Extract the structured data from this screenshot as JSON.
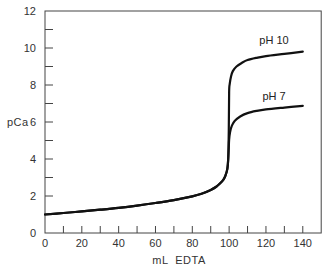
{
  "chart_data": {
    "type": "line",
    "title": "",
    "xlabel": "mL  EDTA",
    "ylabel": "pCa",
    "xlim": [
      0,
      150
    ],
    "ylim": [
      0,
      12
    ],
    "grid": false,
    "legend": "inline labels at curve ends",
    "x_ticks": [
      0,
      20,
      40,
      60,
      80,
      100,
      120,
      140
    ],
    "x_minor_ticks": [
      10,
      30,
      50,
      70,
      90,
      110,
      130
    ],
    "y_ticks": [
      0,
      2,
      4,
      6,
      8,
      10,
      12
    ],
    "y_minor_ticks": [
      1,
      3,
      5,
      7,
      9,
      11
    ],
    "series": [
      {
        "name": "pH 10",
        "label": "pH 10",
        "x": [
          0,
          10,
          20,
          30,
          40,
          50,
          60,
          70,
          80,
          85,
          90,
          93,
          95,
          97,
          98,
          99,
          99.5,
          99.8,
          100,
          100.3,
          101,
          102,
          104,
          107,
          110,
          115,
          120,
          130,
          140
        ],
        "y": [
          1.0,
          1.08,
          1.17,
          1.26,
          1.36,
          1.48,
          1.62,
          1.78,
          1.98,
          2.12,
          2.33,
          2.5,
          2.67,
          2.9,
          3.1,
          3.45,
          4.0,
          5.5,
          7.6,
          8.05,
          8.45,
          8.75,
          9.0,
          9.2,
          9.35,
          9.47,
          9.56,
          9.68,
          9.8
        ]
      },
      {
        "name": "pH 7",
        "label": "pH 7",
        "x": [
          0,
          10,
          20,
          30,
          40,
          50,
          60,
          70,
          80,
          85,
          90,
          93,
          95,
          97,
          98,
          99,
          99.5,
          99.8,
          100,
          100.5,
          101.5,
          103,
          106,
          110,
          115,
          120,
          130,
          140
        ],
        "y": [
          1.0,
          1.08,
          1.17,
          1.26,
          1.36,
          1.48,
          1.62,
          1.78,
          1.98,
          2.12,
          2.33,
          2.5,
          2.67,
          2.9,
          3.1,
          3.45,
          4.0,
          4.6,
          5.05,
          5.45,
          5.8,
          6.05,
          6.3,
          6.48,
          6.6,
          6.68,
          6.78,
          6.87
        ]
      }
    ]
  },
  "labels": {
    "xlabel": "mL  EDTA",
    "ylabel": "pCa",
    "series_ph10": "pH 10",
    "series_ph7": "pH 7",
    "x_tick_labels": [
      "0",
      "20",
      "40",
      "60",
      "80",
      "100",
      "120",
      "140"
    ],
    "y_tick_labels": [
      "0",
      "2",
      "4",
      "6",
      "8",
      "10",
      "12"
    ]
  },
  "style": {
    "line_color": "#111111",
    "axis_color": "#444444",
    "text_color": "#333333"
  }
}
